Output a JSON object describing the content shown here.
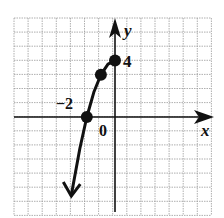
{
  "chart_data": {
    "type": "line",
    "title": "",
    "xlabel": "x",
    "ylabel": "y",
    "xlim": [
      -7,
      7
    ],
    "ylim": [
      -7,
      7
    ],
    "grid": true,
    "grid_step": 1,
    "tick_labels": {
      "origin": "0",
      "y_tick": "4",
      "x_tick": "−2"
    },
    "series": [
      {
        "name": "y = 4 - x^2 (x <= 0)",
        "points": [
          [
            -2,
            0
          ],
          [
            -1,
            3
          ],
          [
            0,
            4
          ]
        ],
        "curve_x": [
          -3.1,
          -3,
          -2.5,
          -2,
          -1.5,
          -1,
          -0.5,
          0
        ],
        "curve_y": [
          -5.61,
          -5,
          -2.25,
          0,
          1.75,
          3,
          3.75,
          4
        ],
        "end_arrow": "down",
        "color": "#111111"
      }
    ]
  },
  "labels": {
    "x_axis": "x",
    "y_axis": "y",
    "origin": "0",
    "y_four": "4",
    "x_neg_two": "−2"
  },
  "colors": {
    "grid": "#9a9a9a",
    "axis": "#111111",
    "curve": "#111111"
  }
}
